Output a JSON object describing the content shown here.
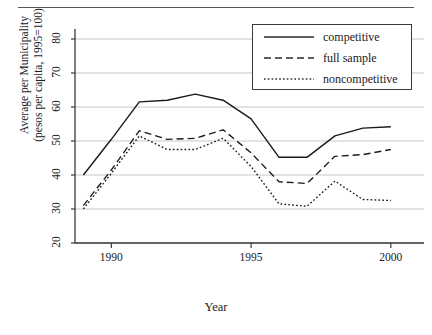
{
  "figure": {
    "has_top_rule": true,
    "background": "#ffffff",
    "ink": "#1a1a1a",
    "gridline_color": "#c8c8c8"
  },
  "legend": {
    "position": "top-right",
    "entries": [
      {
        "label": "competitive",
        "style": "solid"
      },
      {
        "label": "full sample",
        "style": "dashed"
      },
      {
        "label": "noncompetitive",
        "style": "dotted"
      }
    ]
  },
  "chart_data": {
    "type": "line",
    "title": "",
    "xlabel": "Year",
    "ylabel": "Average per Municipality (pesos per capita, 1995=100)",
    "ylabel_line1": "Average per Municipality",
    "ylabel_line2": "(pesos per capita, 1995=100)",
    "x": [
      1989,
      1990,
      1991,
      1992,
      1993,
      1994,
      1995,
      1996,
      1997,
      1998,
      1999,
      2000
    ],
    "xlim": [
      1988.7,
      2000.4
    ],
    "ylim": [
      20,
      84
    ],
    "xticks": [
      1990,
      1995,
      2000
    ],
    "xtick_labels": [
      "1990",
      "1995",
      "2000"
    ],
    "yticks": [
      20,
      30,
      40,
      50,
      60,
      70,
      80
    ],
    "ytick_labels": [
      "20",
      "30",
      "40",
      "50",
      "60",
      "70",
      "80"
    ],
    "grid": "horizontal",
    "series": [
      {
        "name": "competitive",
        "style": "solid",
        "values": [
          40.0,
          50.5,
          61.5,
          62.0,
          63.8,
          62.0,
          56.5,
          45.2,
          45.2,
          51.5,
          53.8,
          54.2
        ]
      },
      {
        "name": "full sample",
        "style": "dashed",
        "values": [
          31.0,
          41.5,
          53.0,
          50.5,
          50.8,
          53.3,
          46.5,
          38.0,
          37.5,
          45.5,
          46.0,
          47.5
        ]
      },
      {
        "name": "noncompetitive",
        "style": "dotted",
        "values": [
          30.0,
          40.5,
          51.5,
          47.5,
          47.5,
          50.8,
          42.5,
          31.5,
          30.8,
          38.2,
          32.8,
          32.5
        ]
      }
    ]
  }
}
